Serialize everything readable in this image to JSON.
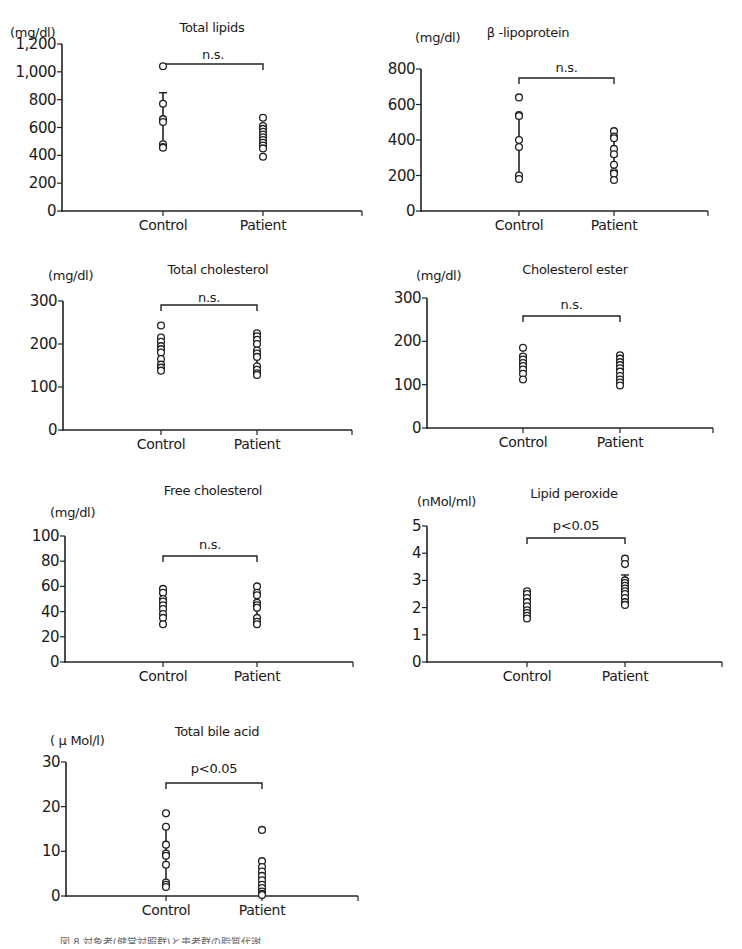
{
  "chart_data": [
    {
      "type": "scatter",
      "title": "Total lipids",
      "ylabel": "(mg/dl)",
      "categories": [
        "Control",
        "Patient"
      ],
      "yticks": [
        "0",
        "200",
        "400",
        "600",
        "800",
        "1,000",
        "1,200"
      ],
      "ylim": [
        0,
        1200
      ],
      "significance": "n.s.",
      "series": [
        {
          "name": "Control",
          "values": [
            1040,
            770,
            660,
            640,
            480,
            460,
            455
          ],
          "mean": 650,
          "sd": 200
        },
        {
          "name": "Patient",
          "values": [
            670,
            610,
            590,
            570,
            550,
            530,
            510,
            490,
            470,
            450,
            390
          ],
          "mean": 540,
          "sd": 70
        }
      ]
    },
    {
      "type": "scatter",
      "title": "β -lipoprotein",
      "ylabel": "(mg/dl)",
      "categories": [
        "Control",
        "Patient"
      ],
      "yticks": [
        "0",
        "200",
        "400",
        "600",
        "800"
      ],
      "ylim": [
        0,
        800
      ],
      "significance": "n.s.",
      "series": [
        {
          "name": "Control",
          "values": [
            640,
            540,
            535,
            400,
            360,
            200,
            180
          ],
          "mean": 360,
          "sd": 170
        },
        {
          "name": "Patient",
          "values": [
            450,
            420,
            410,
            350,
            320,
            260,
            220,
            210,
            175
          ],
          "mean": 310,
          "sd": 100
        }
      ]
    },
    {
      "type": "scatter",
      "title": "Total cholesterol",
      "ylabel": "(mg/dl)",
      "categories": [
        "Control",
        "Patient"
      ],
      "yticks": [
        "0",
        "100",
        "200",
        "300"
      ],
      "ylim": [
        0,
        300
      ],
      "significance": "n.s.",
      "series": [
        {
          "name": "Control",
          "values": [
            243,
            215,
            205,
            195,
            188,
            180,
            165,
            152,
            145,
            138
          ],
          "mean": 185,
          "sd": 30
        },
        {
          "name": "Patient",
          "values": [
            225,
            218,
            210,
            200,
            185,
            178,
            170,
            148,
            140,
            132,
            128
          ],
          "mean": 177,
          "sd": 32
        }
      ]
    },
    {
      "type": "scatter",
      "title": "Cholesterol ester",
      "ylabel": "(mg/dl)",
      "categories": [
        "Control",
        "Patient"
      ],
      "yticks": [
        "0",
        "100",
        "200",
        "300"
      ],
      "ylim": [
        0,
        300
      ],
      "significance": "n.s.",
      "series": [
        {
          "name": "Control",
          "values": [
            185,
            165,
            158,
            150,
            143,
            135,
            125,
            112
          ],
          "mean": 147,
          "sd": 22
        },
        {
          "name": "Patient",
          "values": [
            168,
            160,
            152,
            145,
            138,
            130,
            120,
            112,
            105,
            98
          ],
          "mean": 133,
          "sd": 24
        }
      ]
    },
    {
      "type": "scatter",
      "title": "Free cholesterol",
      "ylabel": "(mg/dl)",
      "categories": [
        "Control",
        "Patient"
      ],
      "yticks": [
        "0",
        "20",
        "40",
        "60",
        "80",
        "100"
      ],
      "ylim": [
        0,
        100
      ],
      "significance": "n.s.",
      "series": [
        {
          "name": "Control",
          "values": [
            58,
            55,
            50,
            48,
            45,
            42,
            38,
            35,
            30
          ],
          "mean": 45,
          "sd": 9
        },
        {
          "name": "Patient",
          "values": [
            60,
            55,
            53,
            47,
            45,
            43,
            35,
            32,
            30
          ],
          "mean": 45,
          "sd": 10
        }
      ]
    },
    {
      "type": "scatter",
      "title": "Lipid peroxide",
      "ylabel": "(nMol/ml)",
      "categories": [
        "Control",
        "Patient"
      ],
      "yticks": [
        "0",
        "1",
        "2",
        "3",
        "4",
        "5"
      ],
      "ylim": [
        0,
        5
      ],
      "significance": "p<0.05",
      "series": [
        {
          "name": "Control",
          "values": [
            2.6,
            2.5,
            2.35,
            2.2,
            2.05,
            1.9,
            1.8,
            1.7,
            1.6
          ],
          "mean": 2.1,
          "sd": 0.35
        },
        {
          "name": "Patient",
          "values": [
            3.8,
            3.6,
            3.0,
            2.9,
            2.8,
            2.7,
            2.6,
            2.5,
            2.35,
            2.2,
            2.1
          ],
          "mean": 2.8,
          "sd": 0.4
        }
      ]
    },
    {
      "type": "scatter",
      "title": "Total bile acid",
      "ylabel": "( μ Mol/l)",
      "categories": [
        "Control",
        "Patient"
      ],
      "yticks": [
        "0",
        "10",
        "20",
        "30"
      ],
      "ylim": [
        0,
        30
      ],
      "significance": "p<0.05",
      "series": [
        {
          "name": "Control",
          "values": [
            18.5,
            15.5,
            11.5,
            9.5,
            9.0,
            7.0,
            3.0,
            2.5,
            2.0
          ],
          "mean": 8.8,
          "sd": 6.5
        },
        {
          "name": "Patient",
          "values": [
            14.8,
            7.8,
            6.5,
            5.5,
            4.5,
            3.5,
            2.5,
            1.8,
            1.0,
            0.5,
            0.2
          ],
          "mean": 4.0,
          "sd": 4.0
        }
      ]
    }
  ],
  "caption": "図 8 対象者(健常対照群)と患者群の脂質代謝 …"
}
